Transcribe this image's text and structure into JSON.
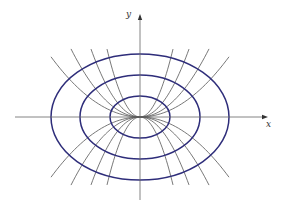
{
  "figure": {
    "colors": {
      "ellipse": "#2e2d7a",
      "trajectory": "#555555",
      "axis": "#666666",
      "background": "#ffffff"
    },
    "origin_px": [
      140,
      117
    ],
    "axes": {
      "x_label": "x",
      "y_label": "y",
      "x_range_px": [
        15,
        268
      ],
      "y_range_px": [
        14,
        200
      ]
    },
    "ellipses": [
      {
        "rx": 30,
        "ry": 21
      },
      {
        "rx": 60,
        "ry": 42
      },
      {
        "rx": 89,
        "ry": 63
      }
    ],
    "trajectories": [
      {
        "k": 0.0076,
        "x_extent": 89
      },
      {
        "k": 0.0143,
        "x_extent": 69
      },
      {
        "k": 0.0283,
        "x_extent": 49
      },
      {
        "k": 0.0624,
        "x_extent": 33
      }
    ]
  }
}
